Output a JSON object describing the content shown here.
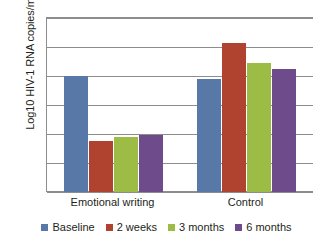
{
  "chart_data": {
    "type": "bar",
    "title": "",
    "xlabel": "",
    "ylabel": "Log10 HIV-1 RNA copies/m",
    "categories": [
      "Emotional writing",
      "Control"
    ],
    "series": [
      {
        "name": "Baseline",
        "color": "#5878a8",
        "values": [
          3.3,
          3.29
        ]
      },
      {
        "name": "2 weeks",
        "color": "#b0432f",
        "values": [
          3.075,
          3.415
        ]
      },
      {
        "name": "3 months",
        "color": "#9cbc46",
        "values": [
          3.088,
          3.345
        ]
      },
      {
        "name": "6 months",
        "color": "#6e4c8c",
        "values": [
          3.098,
          3.325
        ]
      }
    ],
    "ylim": [
      2.9,
      3.5
    ],
    "yticks": [
      "2.9",
      "3",
      "3.1",
      "3.2",
      "3.3",
      "3.4",
      "3.5"
    ],
    "ytick_values": [
      2.9,
      3.0,
      3.1,
      3.2,
      3.3,
      3.4,
      3.5
    ],
    "grid": true,
    "legend_position": "bottom",
    "axis_color": "#8d8d8d",
    "text_color": "#231f20",
    "background": "#ffffff"
  }
}
